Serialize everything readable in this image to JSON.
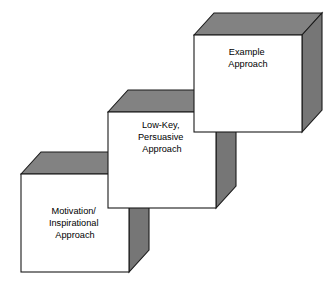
{
  "diagram": {
    "background_color": "#ffffff",
    "outline_color": "#1a1a1a",
    "top_face_color": "#828282",
    "side_face_color": "#767676",
    "front_face_color": "#ffffff",
    "depth_offset": {
      "dx": 20,
      "dy": -22
    },
    "steps": [
      {
        "id": "step-1",
        "position": "bottom-left",
        "lines": [
          "Motivation/",
          "Inspirational",
          "Approach"
        ],
        "front_face": {
          "x": 21,
          "y": 174,
          "width": 108,
          "height": 98
        },
        "text_center": {
          "x": 75,
          "y": 223
        }
      },
      {
        "id": "step-2",
        "position": "middle",
        "lines": [
          "Low-Key,",
          "Persuasive",
          "Approach"
        ],
        "front_face": {
          "x": 108,
          "y": 112,
          "width": 108,
          "height": 96
        },
        "text_center": {
          "x": 162,
          "y": 137
        }
      },
      {
        "id": "step-3",
        "position": "top-right",
        "lines": [
          "Example",
          "Approach"
        ],
        "front_face": {
          "x": 194,
          "y": 35,
          "width": 108,
          "height": 97
        },
        "text_center": {
          "x": 248,
          "y": 58
        }
      }
    ]
  }
}
